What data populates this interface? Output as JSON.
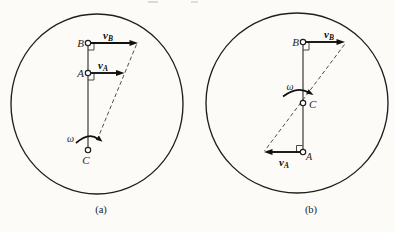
{
  "colors": {
    "ink": "#1f1f1f",
    "paper": "#fcfbf8"
  },
  "figure": {
    "panel_a": {
      "caption": "(a)",
      "point_b": "B",
      "point_a": "A",
      "point_c": "C",
      "omega": "ω",
      "velocity_symbol": "v",
      "v_b_subscript": "B",
      "v_a_subscript": "A"
    },
    "panel_b": {
      "caption": "(b)",
      "point_b": "B",
      "point_a": "A",
      "point_c": "C",
      "omega": "ω",
      "velocity_symbol": "v",
      "v_b_subscript": "B",
      "v_a_subscript": "A"
    }
  }
}
